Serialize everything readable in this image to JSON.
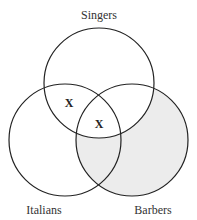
{
  "diagram": {
    "type": "venn-3",
    "sets": [
      {
        "name": "Singers",
        "label_position": "top"
      },
      {
        "name": "Italians",
        "label_position": "bottom-left"
      },
      {
        "name": "Barbers",
        "label_position": "bottom-right"
      }
    ],
    "shaded_region": "Barbers outside Singers",
    "shade_color": "#ececec",
    "stroke_color": "#222222",
    "marks": [
      {
        "text": "X",
        "region": "Singers ∩ Italians (not Barbers)"
      },
      {
        "text": "X",
        "region": "Singers ∩ Italians ∩ Barbers"
      }
    ]
  }
}
